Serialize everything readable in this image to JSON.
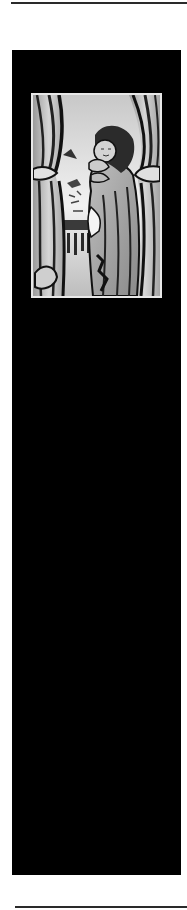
{
  "layout": {
    "background_color": "#ffffff",
    "rule_color": "#2a2a2a",
    "panel_color": "#000000",
    "frame_border_color": "#e8e8e8"
  },
  "illustration": {
    "subject": "woodcut of a figure peeking between parted curtains",
    "style": "black-and-white linocut",
    "icon": "curtain-figure-illustration"
  }
}
